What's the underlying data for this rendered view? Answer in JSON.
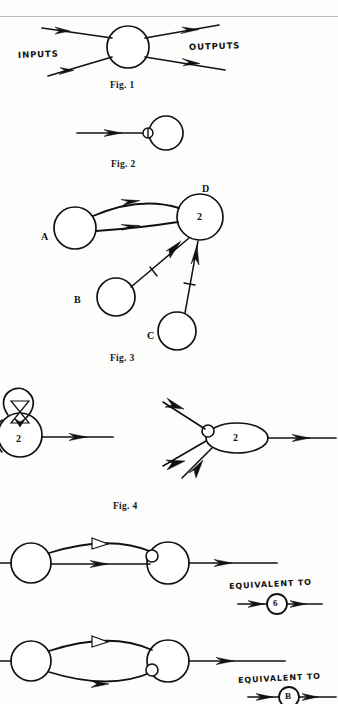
{
  "page": {
    "background_color": "#fdfdfc",
    "ink_color": "#111111",
    "rule_color": "#b9b9b9",
    "kind": "scanned-book-page-figures"
  },
  "figures": [
    {
      "id": "fig1",
      "caption": "Fig. 1",
      "labels": {
        "inputs": "INPUTS",
        "outputs": "OUTPUTS"
      },
      "description": "A circle (neuron) with two incoming arrows on the left labelled INPUTS and two outgoing arrows on the right labelled OUTPUTS.",
      "input_count": 2,
      "output_count": 2
    },
    {
      "id": "fig2",
      "caption": "Fig. 2",
      "description": "A single arrow terminating on a small shaded junction circle attached to the left side of a larger circle (neuron).",
      "input_count": 1,
      "output_count": 0,
      "junction": "synapse-circle"
    },
    {
      "id": "fig3",
      "caption": "Fig. 3",
      "nodes": [
        {
          "name": "A",
          "value": ""
        },
        {
          "name": "B",
          "value": ""
        },
        {
          "name": "C",
          "value": ""
        },
        {
          "name": "D",
          "value": "2"
        }
      ],
      "edges": [
        {
          "from": "A",
          "to": "D",
          "marker": "solid-arrow",
          "curved": true
        },
        {
          "from": "A",
          "to": "D",
          "marker": "solid-arrow",
          "curved": false
        },
        {
          "from": "B",
          "to": "D",
          "marker": "solid-arrow",
          "cross": true
        },
        {
          "from": "C",
          "to": "D",
          "marker": "solid-arrow",
          "cross": true
        }
      ],
      "threshold_label": "2",
      "node_d_label": "D"
    },
    {
      "id": "fig4",
      "caption": "Fig. 4",
      "left": {
        "node_label": "2",
        "description": "Circle labelled 2 with a self-loop carrying a hollow bow-tie (double triangle) marker, and one outgoing arrow to the right.",
        "loop_marker": "hollow-bowtie",
        "output_count": 1
      },
      "right": {
        "node_label": "2",
        "description": "Ellipse labelled 2 with three incoming arrows meeting a small junction circle on its left, and one outgoing arrow to the right.",
        "input_count": 3,
        "output_count": 1,
        "junction": "synapse-circle"
      }
    },
    {
      "id": "fig5-top",
      "caption": "",
      "description": "Two circles joined by two curved lines; the upper carries a hollow triangle marker, the lower a solid arrow. The right circle has a junction circle on its left and one outgoing arrow.",
      "equivalent_label": "EQUIVALENT TO",
      "equivalent_node_label": "6",
      "upper_marker": "hollow-triangle",
      "lower_marker": "solid-arrow"
    },
    {
      "id": "fig5-bottom",
      "caption": "",
      "description": "Two circles joined by two bowed lines forming a lens; the upper carries a hollow triangle marker, the lower a solid arrow. The right circle has a junction circle on its left and one outgoing arrow.",
      "equivalent_label": "EQUIVALENT TO",
      "equivalent_node_label": "B",
      "upper_marker": "hollow-triangle",
      "lower_marker": "solid-arrow"
    }
  ]
}
